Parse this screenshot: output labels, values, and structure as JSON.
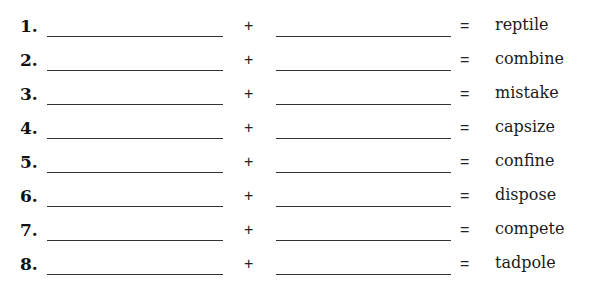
{
  "worksheet": {
    "plus_symbol": "+",
    "equals_symbol": "=",
    "items": [
      {
        "number": "1.",
        "part1": "",
        "part2": "",
        "word": "reptile"
      },
      {
        "number": "2.",
        "part1": "",
        "part2": "",
        "word": "combine"
      },
      {
        "number": "3.",
        "part1": "",
        "part2": "",
        "word": "mistake"
      },
      {
        "number": "4.",
        "part1": "",
        "part2": "",
        "word": "capsize"
      },
      {
        "number": "5.",
        "part1": "",
        "part2": "",
        "word": "confine"
      },
      {
        "number": "6.",
        "part1": "",
        "part2": "",
        "word": "dispose"
      },
      {
        "number": "7.",
        "part1": "",
        "part2": "",
        "word": "compete"
      },
      {
        "number": "8.",
        "part1": "",
        "part2": "",
        "word": "tadpole"
      }
    ]
  }
}
